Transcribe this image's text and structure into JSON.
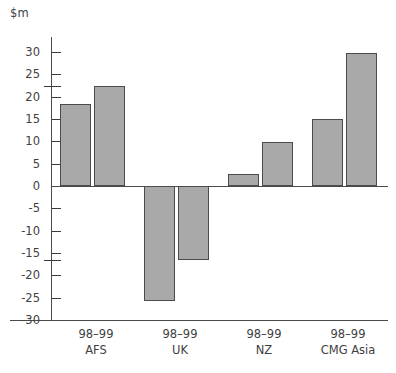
{
  "chart_data": {
    "type": "bar",
    "title": "",
    "subtitle": "",
    "xlabel": "",
    "ylabel": "$m",
    "unit_label": "$m",
    "ylim": [
      -30,
      30
    ],
    "yticks": [
      30,
      25,
      20,
      15,
      10,
      5,
      0,
      -5,
      -10,
      -15,
      -20,
      -25,
      -30
    ],
    "ytick_labels": [
      "30",
      "25",
      "20",
      "15",
      "10",
      "5",
      "0",
      "-5",
      "-10",
      "-15",
      "-20",
      "-25",
      "-30"
    ],
    "extra_ticks": [
      22.5,
      -16.5
    ],
    "grid": false,
    "legend": "none",
    "categories": [
      "AFS",
      "UK",
      "NZ",
      "CMG Asia"
    ],
    "period_label": "98–99",
    "category_labels": [
      {
        "period": "98–99",
        "region": "AFS"
      },
      {
        "period": "98–99",
        "region": "UK"
      },
      {
        "period": "98–99",
        "region": "NZ"
      },
      {
        "period": "98–99",
        "region": "CMG Asia"
      }
    ],
    "series": [
      {
        "name": "bar-1",
        "values": [
          18.3,
          -25.8,
          2.7,
          15.1
        ]
      },
      {
        "name": "bar-2",
        "values": [
          22.5,
          -16.5,
          9.8,
          29.8
        ]
      }
    ],
    "bar_fill_color": "#a9a9a9",
    "bar_border_color": "#4b4b4b",
    "axis_color": "#4a4a4a",
    "text_color": "#3f3f3f"
  }
}
